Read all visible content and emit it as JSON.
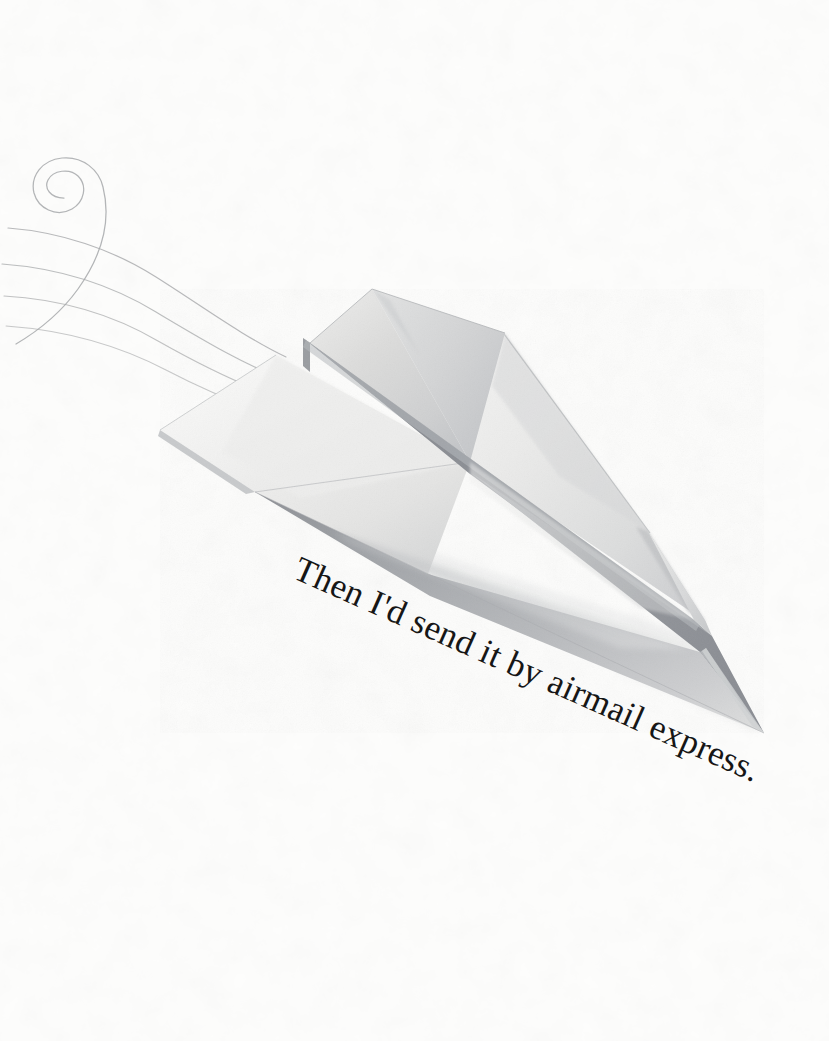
{
  "page": {
    "background_color": "#fdfdfc",
    "width": 829,
    "height": 1041
  },
  "caption": {
    "text": "Then I'd send it by airmail express.",
    "color": "#161616",
    "rotation_degrees": 23.9,
    "font_style": "old-style serif"
  },
  "illustration": {
    "subject_name": "paper-airplane",
    "medium": "watercolor and pencil drawing",
    "paper_colors": {
      "highlight": "#fbfbfa",
      "light": "#f1f1f0",
      "mid": "#dededd",
      "shade": "#c6c7c9",
      "deep_shade": "#a8abaf",
      "keel": "#8d9096",
      "keel_dark": "#7d8087",
      "edge_line": "#9fa2a6"
    },
    "parts": [
      {
        "name": "left-wing-upper",
        "label": "Left wing top surface"
      },
      {
        "name": "right-wing-upper",
        "label": "Right wing top surface"
      },
      {
        "name": "tail-fin",
        "label": "Raised tail fin"
      },
      {
        "name": "center-keel",
        "label": "Central fold keel"
      },
      {
        "name": "near-wing-underside",
        "label": "Near wing underside in shadow"
      },
      {
        "name": "nose-tip",
        "label": "Nose tip"
      }
    ]
  },
  "motion_lines": {
    "name": "speed-lines",
    "color": "#a6a8aa",
    "stroke_count": 4,
    "has_spiral_curl": true,
    "spiral": {
      "center_x": 62,
      "center_y": 190,
      "radius": 19
    }
  }
}
